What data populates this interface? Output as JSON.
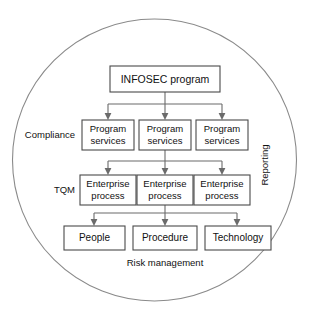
{
  "diagram": {
    "type": "hierarchy-flowchart",
    "enclosure": {
      "shape": "circle",
      "label": ""
    },
    "levels": [
      {
        "level": 1,
        "nodes": [
          {
            "id": "infosec-program",
            "label": "INFOSEC program"
          }
        ]
      },
      {
        "level": 2,
        "row_label": "Compliance",
        "nodes": [
          {
            "id": "program-services-1",
            "label": "Program\nservices",
            "line1": "Program",
            "line2": "services"
          },
          {
            "id": "program-services-2",
            "label": "Program\nservices",
            "line1": "Program",
            "line2": "services"
          },
          {
            "id": "program-services-3",
            "label": "Program\nservices",
            "line1": "Program",
            "line2": "services"
          }
        ]
      },
      {
        "level": 3,
        "row_label": "TQM",
        "nodes": [
          {
            "id": "enterprise-process-1",
            "label": "Enterprise\nprocess",
            "line1": "Enterprise",
            "line2": "process"
          },
          {
            "id": "enterprise-process-2",
            "label": "Enterprise\nprocess",
            "line1": "Enterprise",
            "line2": "process"
          },
          {
            "id": "enterprise-process-3",
            "label": "Enterprise\nprocess",
            "line1": "Enterprise",
            "line2": "process"
          }
        ]
      },
      {
        "level": 4,
        "nodes": [
          {
            "id": "people",
            "label": "People"
          },
          {
            "id": "procedure",
            "label": "Procedure"
          },
          {
            "id": "technology",
            "label": "Technology"
          }
        ]
      }
    ],
    "side_labels": {
      "left_upper": "Compliance",
      "left_lower": "TQM",
      "right_rotated": "Reporting",
      "bottom_caption": "Risk management"
    },
    "colors": {
      "box_stroke": "#4a4a4a",
      "box_fill": "#ffffff",
      "connector": "#6b6b6b",
      "circle_stroke": "#8a8a8a",
      "text": "#111111",
      "background": "#ffffff"
    },
    "clipped_caption": "",
    "node_text": {
      "infosec": "INFOSEC program",
      "program_line1": "Program",
      "program_line2": "services",
      "enterprise_line1": "Enterprise",
      "enterprise_line2": "process",
      "people": "People",
      "procedure": "Procedure",
      "technology": "Technology"
    }
  }
}
